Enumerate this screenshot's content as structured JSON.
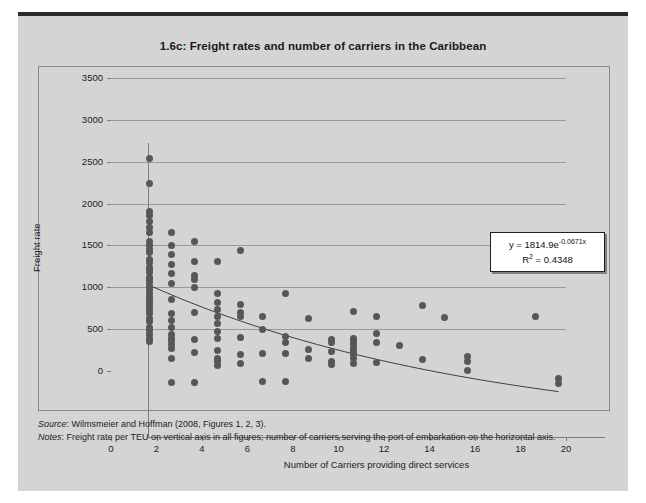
{
  "figure": {
    "title": "1.6c:  Freight rates and number of carriers in the Caribbean",
    "source_label": "Source",
    "source_text": ": Wilmsmeier and Hoffman (2008, Figures 1, 2, 3).",
    "notes_label": "Notes",
    "notes_text": ": Freight rate per TEU on vertical axis in all figures; number of carriers serving the port of embarkation on the horizontal axis."
  },
  "equation_box": {
    "equation_prefix": "y = 1814.9e",
    "equation_exponent": "-0.0671x",
    "r_squared_prefix": "R",
    "r_squared_sup": "2",
    "r_squared_value": " = 0.4348"
  },
  "colors": {
    "page_background": "#ffffff",
    "panel_background": "#d4d4d4",
    "plot_background": "#d4d4d4",
    "point_fill": "#575757",
    "gridline": "#9a9a9a",
    "axis": "#7d7d7d",
    "trendline": "#3c3c3c",
    "title_text": "#1a1a1a",
    "top_rule": "#2b2b2b"
  },
  "chart_data": {
    "type": "scatter",
    "title": "1.6c:  Freight rates and number of carriers in the Caribbean",
    "xlabel": "Number of Carriers providing direct services",
    "ylabel": "Freight rate",
    "xlim": [
      0,
      20
    ],
    "ylim": [
      0,
      3500
    ],
    "xticks": [
      0,
      2,
      4,
      6,
      8,
      10,
      12,
      14,
      16,
      18,
      20
    ],
    "yticks": [
      0,
      500,
      1000,
      1500,
      2000,
      2500,
      3000,
      3500
    ],
    "grid": "horizontal",
    "legend": "none",
    "annotation": "y = 1814.9e^-0.0671x ; R^2 = 0.4348",
    "trendline": {
      "type": "exponential",
      "coefficient": 1814.9,
      "exponent": -0.0671,
      "r_squared": 0.4348,
      "x_start": 0,
      "x_end": 18
    },
    "points": [
      [
        0,
        3330
      ],
      [
        0,
        3030
      ],
      [
        0,
        2690
      ],
      [
        0,
        2640
      ],
      [
        0,
        2570
      ],
      [
        0,
        2500
      ],
      [
        0,
        2440
      ],
      [
        0,
        2330
      ],
      [
        0,
        2290
      ],
      [
        0,
        2240
      ],
      [
        0,
        2200
      ],
      [
        0,
        2120
      ],
      [
        0,
        2080
      ],
      [
        0,
        2030
      ],
      [
        0,
        1990
      ],
      [
        0,
        1960
      ],
      [
        0,
        1910
      ],
      [
        0,
        1880
      ],
      [
        0,
        1840
      ],
      [
        0,
        1800
      ],
      [
        0,
        1760
      ],
      [
        0,
        1710
      ],
      [
        0,
        1670
      ],
      [
        0,
        1630
      ],
      [
        0,
        1600
      ],
      [
        0,
        1560
      ],
      [
        0,
        1510
      ],
      [
        0,
        1470
      ],
      [
        0,
        1420
      ],
      [
        0,
        1380
      ],
      [
        0,
        1310
      ],
      [
        0,
        1270
      ],
      [
        0,
        1220
      ],
      [
        0,
        1180
      ],
      [
        0,
        1140
      ],
      [
        1,
        2440
      ],
      [
        1,
        2290
      ],
      [
        1,
        2180
      ],
      [
        1,
        2060
      ],
      [
        1,
        1950
      ],
      [
        1,
        1830
      ],
      [
        1,
        1640
      ],
      [
        1,
        1480
      ],
      [
        1,
        1390
      ],
      [
        1,
        1310
      ],
      [
        1,
        1230
      ],
      [
        1,
        1180
      ],
      [
        1,
        1150
      ],
      [
        1,
        1110
      ],
      [
        1,
        1060
      ],
      [
        1,
        940
      ],
      [
        1,
        650
      ],
      [
        2,
        2330
      ],
      [
        2,
        2100
      ],
      [
        2,
        1930
      ],
      [
        2,
        1880
      ],
      [
        2,
        1790
      ],
      [
        2,
        1490
      ],
      [
        2,
        1170
      ],
      [
        2,
        1010
      ],
      [
        2,
        650
      ],
      [
        3,
        2100
      ],
      [
        3,
        1720
      ],
      [
        3,
        1610
      ],
      [
        3,
        1520
      ],
      [
        3,
        1440
      ],
      [
        3,
        1350
      ],
      [
        3,
        1260
      ],
      [
        3,
        1180
      ],
      [
        3,
        1030
      ],
      [
        3,
        940
      ],
      [
        3,
        900
      ],
      [
        3,
        860
      ],
      [
        4,
        2230
      ],
      [
        4,
        1580
      ],
      [
        4,
        1490
      ],
      [
        4,
        1440
      ],
      [
        4,
        1190
      ],
      [
        4,
        990
      ],
      [
        4,
        880
      ],
      [
        5,
        1440
      ],
      [
        5,
        1290
      ],
      [
        5,
        1000
      ],
      [
        5,
        660
      ],
      [
        6,
        1720
      ],
      [
        6,
        1200
      ],
      [
        6,
        1130
      ],
      [
        6,
        1000
      ],
      [
        6,
        660
      ],
      [
        7,
        1410
      ],
      [
        7,
        1050
      ],
      [
        7,
        940
      ],
      [
        8,
        1170
      ],
      [
        8,
        1130
      ],
      [
        8,
        1020
      ],
      [
        8,
        900
      ],
      [
        8,
        870
      ],
      [
        9,
        1500
      ],
      [
        9,
        1180
      ],
      [
        9,
        1140
      ],
      [
        9,
        1100
      ],
      [
        9,
        1060
      ],
      [
        9,
        1020
      ],
      [
        9,
        980
      ],
      [
        9,
        940
      ],
      [
        9,
        880
      ],
      [
        10,
        1440
      ],
      [
        10,
        1240
      ],
      [
        10,
        1130
      ],
      [
        10,
        890
      ],
      [
        11,
        1090
      ],
      [
        12,
        1570
      ],
      [
        12,
        920
      ],
      [
        13,
        1430
      ],
      [
        14,
        960
      ],
      [
        14,
        900
      ],
      [
        14,
        790
      ],
      [
        17,
        1440
      ],
      [
        18,
        700
      ],
      [
        18,
        640
      ]
    ]
  },
  "axis_labels": {
    "y": [
      "3500",
      "3000",
      "2500",
      "2000",
      "1500",
      "1000",
      "500",
      "0"
    ],
    "x": [
      "0",
      "2",
      "4",
      "6",
      "8",
      "10",
      "12",
      "14",
      "16",
      "18",
      "20"
    ]
  }
}
